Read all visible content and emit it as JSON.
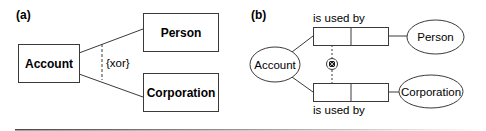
{
  "panel_a": {
    "label": "(a)",
    "entities": {
      "account": "Account",
      "person": "Person",
      "corporation": "Corporation"
    },
    "constraint": "{xor}"
  },
  "panel_b": {
    "label": "(b)",
    "entities": {
      "account": "Account",
      "person": "Person",
      "corporation": "Corporation"
    },
    "fact_types": {
      "upper": "is used by",
      "lower": "is used by"
    },
    "constraint_symbol": "exclusion-or-icon"
  },
  "colors": {
    "stroke": "#3a3a3a",
    "text": "#1a1a1a",
    "rule": "#555555"
  }
}
